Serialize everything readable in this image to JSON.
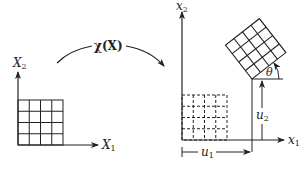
{
  "diagram": {
    "left_frame": {
      "axis_x_label": "X",
      "axis_x_sub": "1",
      "axis_y_label": "X",
      "axis_y_sub": "2",
      "grid": {
        "rows": 4,
        "cols": 4,
        "style": "solid"
      }
    },
    "mapping": {
      "label": "χ(X)"
    },
    "right_frame": {
      "axis_x_label": "x",
      "axis_x_sub": "1",
      "axis_y_label": "x",
      "axis_y_sub": "2",
      "reference_grid": {
        "rows": 4,
        "cols": 4,
        "style": "dashed"
      },
      "deformed_grid": {
        "rows": 4,
        "cols": 4,
        "style": "solid",
        "rotation": "θ"
      },
      "translation_x_label": "u",
      "translation_x_sub": "1",
      "translation_y_label": "u",
      "translation_y_sub": "2",
      "angle_label": "θ"
    },
    "colors": {
      "ink": "#222222",
      "background": "#ffffff"
    }
  }
}
